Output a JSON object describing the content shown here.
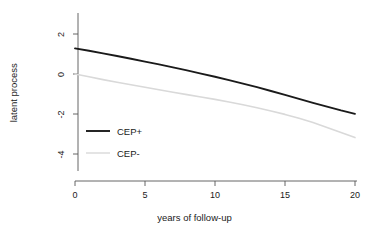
{
  "chart_data": {
    "type": "line",
    "title": "",
    "subtitle": "",
    "xlabel": "years of follow-up",
    "ylabel": "latent process",
    "xlim": [
      0,
      20
    ],
    "ylim": [
      -5.2,
      2.9
    ],
    "xticks": [
      0,
      5,
      10,
      15,
      20
    ],
    "xtick_labels": [
      "0",
      "5",
      "10",
      "15",
      "20"
    ],
    "yticks": [
      2,
      0,
      -2,
      -4
    ],
    "ytick_labels": [
      "2",
      "0",
      "-2",
      "-4"
    ],
    "grid": false,
    "legend_position": "inside-lower-left",
    "x": [
      0,
      1,
      2,
      3,
      4,
      5,
      6,
      7,
      8,
      9,
      10,
      11,
      12,
      13,
      14,
      15,
      16,
      17,
      18,
      19,
      20
    ],
    "series": [
      {
        "name": "CEP+",
        "color": "#1a1a1a",
        "linewidth": 1.9,
        "values": [
          1.28,
          1.16,
          1.03,
          0.9,
          0.76,
          0.62,
          0.48,
          0.33,
          0.18,
          0.02,
          -0.14,
          -0.31,
          -0.48,
          -0.66,
          -0.85,
          -1.04,
          -1.24,
          -1.44,
          -1.63,
          -1.82,
          -1.99
        ]
      },
      {
        "name": "CEP-",
        "color": "#d9d9d9",
        "linewidth": 1.6,
        "values": [
          0.0,
          -0.14,
          -0.28,
          -0.41,
          -0.54,
          -0.66,
          -0.79,
          -0.91,
          -1.03,
          -1.15,
          -1.27,
          -1.4,
          -1.54,
          -1.69,
          -1.85,
          -2.02,
          -2.21,
          -2.43,
          -2.67,
          -2.93,
          -3.18
        ]
      }
    ],
    "legend": [
      {
        "label": "CEP+",
        "color": "#1a1a1a",
        "linewidth": 1.9
      },
      {
        "label": "CEP-",
        "color": "#dedede",
        "linewidth": 1.6
      }
    ]
  },
  "axes": {
    "axis_color": "#555555",
    "tick_color": "#555555"
  }
}
